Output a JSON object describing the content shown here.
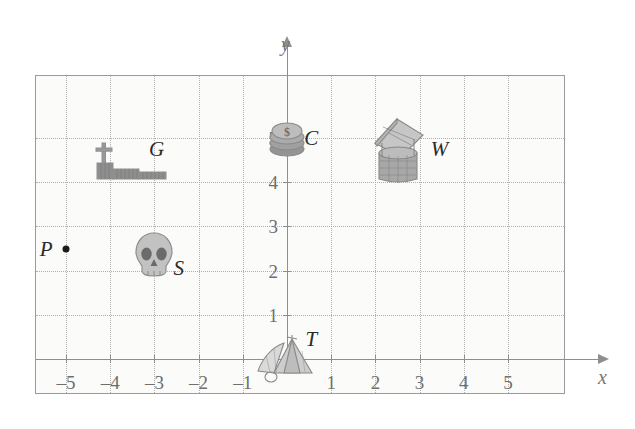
{
  "figure": {
    "axis_x_name": "x",
    "axis_y_name": "y",
    "background_color": "#fbfbf9",
    "grid_color": "#b0b0b0",
    "axis_color": "#8e8e8e",
    "label_color": "#2a2a2a"
  },
  "chart_data": {
    "type": "scatter",
    "title": "",
    "xlabel": "x",
    "ylabel": "y",
    "xlim": [
      -6,
      6
    ],
    "ylim": [
      -1,
      6
    ],
    "grid": true,
    "legend": "none",
    "x_ticks": [
      "-5",
      "-4",
      "-3",
      "-2",
      "-1",
      "1",
      "2",
      "3",
      "4",
      "5"
    ],
    "y_ticks": [
      "1",
      "2",
      "3",
      "4",
      "5"
    ],
    "x_tick_values": [
      -5,
      -4,
      -3,
      -2,
      -1,
      1,
      2,
      3,
      4,
      5
    ],
    "y_tick_values": [
      1,
      2,
      3,
      4,
      5
    ],
    "points": [
      {
        "label": "G",
        "icon": "graveyard-icon",
        "x": -3.5,
        "y": 4.4,
        "label_dx": 0.55,
        "label_dy": 0.35
      },
      {
        "label": "C",
        "icon": "coins-icon",
        "x": 0.0,
        "y": 5.0,
        "label_dx": 0.55,
        "label_dy": 0.0
      },
      {
        "label": "W",
        "icon": "well-icon",
        "x": 2.5,
        "y": 4.7,
        "label_dx": 0.95,
        "label_dy": 0.05
      },
      {
        "label": "P",
        "icon": "dot-point",
        "x": -5.0,
        "y": 2.5,
        "label_dx": -0.45,
        "label_dy": 0.0
      },
      {
        "label": "S",
        "icon": "skull-icon",
        "x": -3.0,
        "y": 2.3,
        "label_dx": 0.55,
        "label_dy": -0.25
      },
      {
        "label": "T",
        "icon": "tent-icon",
        "x": 0.0,
        "y": 0.0,
        "label_dx": 0.55,
        "label_dy": 0.45
      }
    ]
  }
}
